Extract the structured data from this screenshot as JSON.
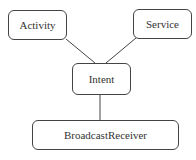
{
  "diagram": {
    "nodes": [
      {
        "id": "activity",
        "label": "Activity",
        "x": 8,
        "y": 10,
        "w": 59,
        "h": 30
      },
      {
        "id": "service",
        "label": "Service",
        "x": 133,
        "y": 9,
        "w": 59,
        "h": 30
      },
      {
        "id": "intent",
        "label": "Intent",
        "x": 72,
        "y": 63,
        "w": 59,
        "h": 32
      },
      {
        "id": "broadcastreceiver",
        "label": "BroadcastReceiver",
        "x": 32,
        "y": 120,
        "w": 147,
        "h": 30
      }
    ],
    "edges": [
      {
        "from": "activity",
        "to": "intent"
      },
      {
        "from": "service",
        "to": "intent"
      },
      {
        "from": "intent",
        "to": "broadcastreceiver"
      }
    ]
  }
}
